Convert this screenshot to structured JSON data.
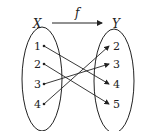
{
  "diagram": {
    "type": "function-mapping",
    "function_label": "f",
    "domain": {
      "label": "X",
      "elements": [
        "1",
        "2",
        "3",
        "4"
      ]
    },
    "codomain": {
      "label": "Y",
      "elements": [
        "2",
        "3",
        "4",
        "5"
      ]
    },
    "mappings": [
      {
        "from": "1",
        "to": "4"
      },
      {
        "from": "2",
        "to": "5"
      },
      {
        "from": "3",
        "to": "3"
      },
      {
        "from": "4",
        "to": "2"
      }
    ],
    "colors": {
      "stroke": "#222222",
      "background": "#ffffff"
    }
  }
}
